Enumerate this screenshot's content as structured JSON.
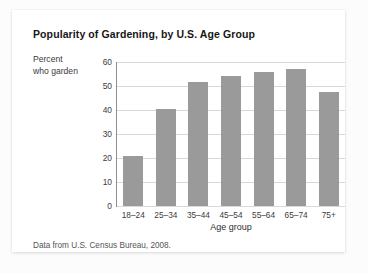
{
  "card": {
    "title": "Popularity of Gardening, by U.S. Age Group",
    "source_note": "Data from U.S. Census Bureau, 2008."
  },
  "colors": {
    "bar_fill": "#9a9a9a",
    "gridline": "#d8d8d8",
    "axis": "#8e8e8e",
    "card_background": "#ffffff",
    "page_background": "#fcfcfc",
    "title_text": "#171717"
  },
  "chart_data": {
    "type": "bar",
    "title": "Popularity of Gardening, by U.S. Age Group",
    "subtitle": "",
    "categories": [
      "18–24",
      "25–34",
      "35–44",
      "45–54",
      "55–64",
      "65–74",
      "75+"
    ],
    "values": [
      21,
      40.5,
      51.5,
      54,
      56,
      57,
      47.5
    ],
    "xlabel": "Age group",
    "ylabel": "Percent who garden",
    "ylabel_lines": [
      "Percent",
      "who garden"
    ],
    "ylim": [
      0,
      60
    ],
    "yticks": [
      0,
      10,
      20,
      30,
      40,
      50,
      60
    ],
    "ytick_labels": [
      "0",
      "10",
      "20",
      "30",
      "40",
      "50",
      "60"
    ],
    "grid": true,
    "grid_orientation": "horizontal",
    "legend": false,
    "legend_position": "none",
    "source": "Data from U.S. Census Bureau, 2008."
  }
}
